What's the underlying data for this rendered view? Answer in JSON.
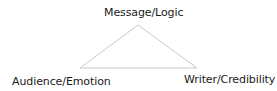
{
  "diagram": {
    "type": "rhetorical-triangle",
    "line_color": "#c8c8c8",
    "vertices": {
      "top": {
        "label": "Message/Logic"
      },
      "left": {
        "label": "Audience/Emotion"
      },
      "right": {
        "label": "Writer/Credibility"
      }
    }
  }
}
